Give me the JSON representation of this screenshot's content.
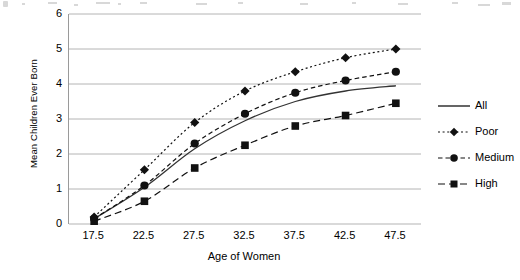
{
  "chart_data": {
    "type": "line",
    "title": "",
    "xlabel": "Age of Women",
    "ylabel": "Mean Children Ever Born",
    "x": [
      17.5,
      22.5,
      27.5,
      32.5,
      37.5,
      42.5,
      47.5
    ],
    "xtick_labels": [
      "17.5",
      "22.5",
      "27.5",
      "32.5",
      "37.5",
      "42.5",
      "47.5"
    ],
    "ytick_labels": [
      "0",
      "1",
      "2",
      "3",
      "4",
      "5",
      "6"
    ],
    "xlim": [
      15.0,
      50.0
    ],
    "ylim": [
      0,
      6
    ],
    "grid": "horizontal",
    "legend_position": "right",
    "series": [
      {
        "name": "All",
        "values": [
          0.15,
          1.05,
          2.15,
          2.95,
          3.5,
          3.8,
          3.95
        ],
        "marker": "none",
        "line_style": "solid",
        "color": "#333333"
      },
      {
        "name": "Poor",
        "values": [
          0.2,
          1.55,
          2.9,
          3.8,
          4.35,
          4.75,
          5.0
        ],
        "marker": "diamond",
        "line_style": "dotted",
        "color": "#111111"
      },
      {
        "name": "Medium",
        "values": [
          0.15,
          1.1,
          2.3,
          3.15,
          3.75,
          4.1,
          4.35
        ],
        "marker": "circle",
        "line_style": "dashed",
        "color": "#111111"
      },
      {
        "name": "High",
        "values": [
          0.08,
          0.65,
          1.6,
          2.25,
          2.8,
          3.1,
          3.45
        ],
        "marker": "square",
        "line_style": "long-dash",
        "color": "#111111"
      }
    ]
  },
  "axes": {
    "y_title": "Mean Children Ever Born",
    "x_title": "Age of Women",
    "y_ticks": [
      "6",
      "5",
      "4",
      "3",
      "2",
      "1",
      "0"
    ],
    "x_ticks": [
      "17.5",
      "22.5",
      "27.5",
      "32.5",
      "37.5",
      "42.5",
      "47.5"
    ]
  },
  "legend": {
    "items": [
      {
        "label": "All",
        "marker": "none",
        "line_style": "solid"
      },
      {
        "label": "Poor",
        "marker": "diamond",
        "line_style": "dotted"
      },
      {
        "label": "Medium",
        "marker": "circle",
        "line_style": "dashed"
      },
      {
        "label": "High",
        "marker": "square",
        "line_style": "long-dash"
      }
    ]
  },
  "colors": {
    "gridline": "#b4b4b4",
    "axis": "#9a9a9a",
    "series": "#111111",
    "background": "#ffffff"
  }
}
